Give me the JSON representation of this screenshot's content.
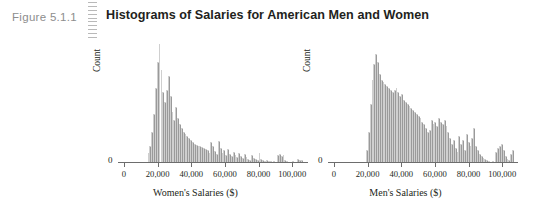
{
  "figure": {
    "number_label": "Figure 5.1.1",
    "title": "Histograms of Salaries for American Men and Women",
    "rule_icon": "dashed-vertical-rule",
    "accent_color": "#8d8d8d",
    "bar_color": "#9a9a9a",
    "axis_color": "#6d6d6d",
    "background_color": "#ffffff"
  },
  "chart_data": [
    {
      "id": "women",
      "type": "bar",
      "title": "",
      "xlabel": "Women's Salaries ($)",
      "ylabel": "Count",
      "grid": false,
      "legend": "none",
      "xlim": [
        0,
        107000
      ],
      "ylim": [
        0,
        118
      ],
      "ytick_labels": [
        "0"
      ],
      "ytick_values": [
        0
      ],
      "xtick_labels": [
        "0",
        "20,000",
        "40,000",
        "60,000",
        "80,000",
        "100,000"
      ],
      "xtick_values": [
        0,
        20000,
        40000,
        60000,
        80000,
        100000
      ],
      "bin_width": 1100,
      "x": [
        14000,
        15100,
        16200,
        17300,
        18400,
        19500,
        20600,
        21700,
        22800,
        23900,
        25000,
        26100,
        27200,
        28300,
        29400,
        30500,
        31600,
        32700,
        33800,
        34900,
        36000,
        37100,
        38200,
        39300,
        40400,
        41500,
        42600,
        43700,
        44800,
        45900,
        47000,
        48100,
        49200,
        50300,
        51400,
        52500,
        53600,
        54700,
        55800,
        56900,
        58000,
        59100,
        60200,
        61300,
        62400,
        63500,
        64600,
        65700,
        66800,
        67900,
        69000,
        70100,
        71200,
        72300,
        73400,
        74500,
        75600,
        76700,
        77800,
        78900,
        80000,
        81100,
        82200,
        83300,
        84400,
        85500,
        86600,
        87700,
        88800,
        89900,
        91000,
        92100,
        93200,
        94300,
        95400,
        96500,
        97600,
        98700,
        99800,
        100900,
        102000,
        103100,
        104200,
        105300
      ],
      "values": [
        9,
        16,
        30,
        48,
        74,
        100,
        118,
        92,
        70,
        60,
        72,
        86,
        66,
        50,
        42,
        55,
        44,
        38,
        34,
        30,
        28,
        26,
        24,
        22,
        20,
        18,
        17,
        16,
        16,
        15,
        14,
        13,
        12,
        9,
        20,
        16,
        11,
        8,
        21,
        14,
        9,
        12,
        7,
        13,
        8,
        6,
        10,
        7,
        5,
        9,
        6,
        4,
        8,
        5,
        3,
        2,
        7,
        4,
        3,
        2,
        9,
        3,
        2,
        1,
        2,
        1,
        1,
        0,
        1,
        0,
        7,
        8,
        6,
        7,
        2,
        1,
        0,
        0,
        1,
        0,
        0,
        3,
        2,
        2
      ]
    },
    {
      "id": "men",
      "type": "bar",
      "title": "",
      "xlabel": "Men's Salaries ($)",
      "ylabel": "Count",
      "grid": false,
      "legend": "none",
      "xlim": [
        0,
        107000
      ],
      "ylim": [
        0,
        118
      ],
      "ytick_labels": [
        "0"
      ],
      "ytick_values": [
        0
      ],
      "xtick_labels": [
        "0",
        "20,000",
        "40,000",
        "60,000",
        "80,000",
        "100,000"
      ],
      "xtick_values": [
        0,
        20000,
        40000,
        60000,
        80000,
        100000
      ],
      "bin_width": 1100,
      "x": [
        19000,
        20100,
        21200,
        22300,
        23400,
        24500,
        25600,
        26700,
        27800,
        28900,
        30000,
        31100,
        32200,
        33300,
        34400,
        35500,
        36600,
        37700,
        38800,
        39900,
        41000,
        42100,
        43200,
        44300,
        45400,
        46500,
        47600,
        48700,
        49800,
        50900,
        52000,
        53100,
        54200,
        55300,
        56400,
        57500,
        58600,
        59700,
        60800,
        61900,
        63000,
        64100,
        65200,
        66300,
        67400,
        68500,
        69600,
        70700,
        71800,
        72900,
        74000,
        75100,
        76200,
        77300,
        78400,
        79500,
        80600,
        81700,
        82800,
        83900,
        85000,
        86100,
        87200,
        88300,
        89400,
        90500,
        91600,
        92700,
        93800,
        94900,
        96000,
        97100,
        98200,
        99300,
        100400,
        101500,
        102600,
        103700,
        104800,
        105900
      ],
      "values": [
        12,
        30,
        58,
        82,
        98,
        108,
        100,
        88,
        82,
        80,
        78,
        76,
        74,
        72,
        70,
        72,
        74,
        70,
        66,
        68,
        62,
        60,
        58,
        56,
        54,
        52,
        50,
        48,
        46,
        44,
        40,
        38,
        34,
        30,
        32,
        42,
        38,
        40,
        36,
        44,
        40,
        38,
        42,
        36,
        30,
        24,
        18,
        22,
        14,
        10,
        26,
        18,
        22,
        12,
        28,
        20,
        16,
        24,
        34,
        16,
        12,
        8,
        6,
        4,
        3,
        2,
        1,
        0,
        1,
        0,
        10,
        14,
        16,
        18,
        12,
        6,
        3,
        2,
        8,
        12,
        6,
        3
      ]
    }
  ]
}
